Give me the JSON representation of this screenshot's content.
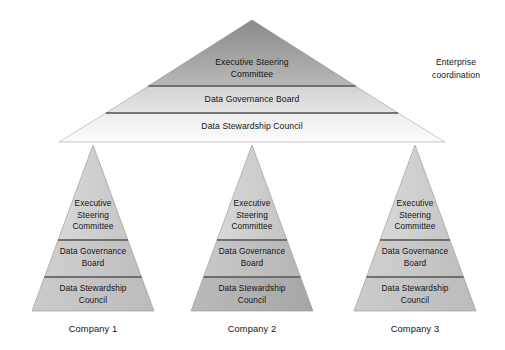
{
  "diagram": {
    "background_color": "#ffffff",
    "text_color": "#141414",
    "enterprise": {
      "annotation": "Enterprise\ncoordination",
      "tiers": [
        {
          "label": "Executive Steering\nCommittee",
          "fill_top": "#8d8d8d",
          "fill_bottom": "#b4b4b4"
        },
        {
          "label": "Data Governance Board",
          "fill_top": "#d4d4d4",
          "fill_bottom": "#e4e4e4"
        },
        {
          "label": "Data Stewardship Council",
          "fill_top": "#f0f0f0",
          "fill_bottom": "#fafafa"
        }
      ]
    },
    "companies": [
      {
        "name": "Company 1",
        "tiers": [
          {
            "label": "Executive\nSteering\nCommittee",
            "fill": "#cfcfcf"
          },
          {
            "label": "Data Governance\nBoard",
            "fill": "#c6c6c6"
          },
          {
            "label": "Data Stewardship\nCouncil",
            "fill": "#c2c2c2"
          }
        ]
      },
      {
        "name": "Company 2",
        "tiers": [
          {
            "label": "Executive\nSteering\nCommittee",
            "fill": "#cfcfcf"
          },
          {
            "label": "Data Governance\nBoard",
            "fill": "#c0c0c0"
          },
          {
            "label": "Data Stewardship\nCouncil",
            "fill": "#b2b2b2"
          }
        ]
      },
      {
        "name": "Company 3",
        "tiers": [
          {
            "label": "Executive\nSteering\nCommittee",
            "fill": "#cfcfcf"
          },
          {
            "label": "Data Governance\nBoard",
            "fill": "#c6c6c6"
          },
          {
            "label": "Data Stewardship\nCouncil",
            "fill": "#c2c2c2"
          }
        ]
      }
    ],
    "divider_color": "#595959",
    "outline_color": "#9a9a9a"
  }
}
